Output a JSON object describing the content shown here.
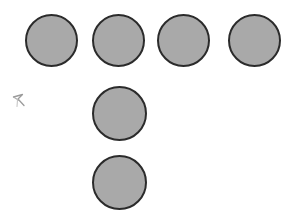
{
  "scene": {
    "title": "Six gray circles arranged in a T shape",
    "width": 304,
    "height": 223,
    "background_color": "#ffffff",
    "shape_type": "circle",
    "shape_count": 6,
    "fill_color": "#a9a9a9",
    "stroke_color": "#2b2b2b",
    "stroke_width": 2,
    "arrangement": "T-shape: horizontal row of 4 on top, vertical column of 3 descending from the second column",
    "circles": [
      {
        "id": "circle-1",
        "label": "top-row-1",
        "x": 25,
        "y": 14,
        "diameter": 53
      },
      {
        "id": "circle-2",
        "label": "top-row-2",
        "x": 92,
        "y": 14,
        "diameter": 53
      },
      {
        "id": "circle-3",
        "label": "top-row-3",
        "x": 157,
        "y": 14,
        "diameter": 53
      },
      {
        "id": "circle-4",
        "label": "top-row-4",
        "x": 228,
        "y": 14,
        "diameter": 53
      },
      {
        "id": "circle-5",
        "label": "column-middle",
        "x": 92,
        "y": 86,
        "diameter": 55
      },
      {
        "id": "circle-6",
        "label": "column-bottom",
        "x": 92,
        "y": 155,
        "diameter": 55
      }
    ],
    "cursor": {
      "name": "arrow-cursor-mark",
      "x": 11,
      "y": 93,
      "width": 18,
      "height": 16,
      "color": "#6b6b6b",
      "direction": "up-left"
    }
  }
}
